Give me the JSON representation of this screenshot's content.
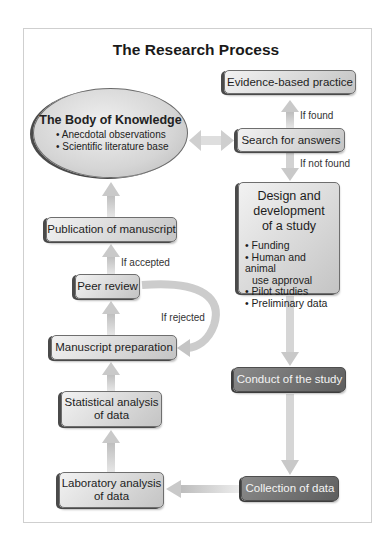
{
  "title": "The Research Process",
  "body_of_knowledge": {
    "heading": "The Body of Knowledge",
    "items": [
      "Anecdotal observations",
      "Scientific literature base"
    ]
  },
  "nodes": {
    "evidence": "Evidence-based practice",
    "search": "Search for answers",
    "design": {
      "heading_lines": [
        "Design and",
        "development",
        "of a study"
      ],
      "items": [
        "Funding",
        "Human and animal",
        "use approval",
        "Pilot studies",
        "Preliminary data"
      ]
    },
    "conduct": "Conduct of the study",
    "collection": "Collection of data",
    "laboratory": [
      "Laboratory analysis",
      "of data"
    ],
    "statistical": [
      "Statistical analysis",
      "of data"
    ],
    "manuscript": "Manuscript preparation",
    "peer_review": "Peer review",
    "publication": "Publication of manuscript"
  },
  "edge_labels": {
    "if_found": "If found",
    "if_not_found": "If not found",
    "if_accepted": "If accepted",
    "if_rejected": "If rejected"
  },
  "colors": {
    "light_box": "#d9d9d9",
    "dark_box": "#707070",
    "arrow": "#c8c8c8"
  }
}
